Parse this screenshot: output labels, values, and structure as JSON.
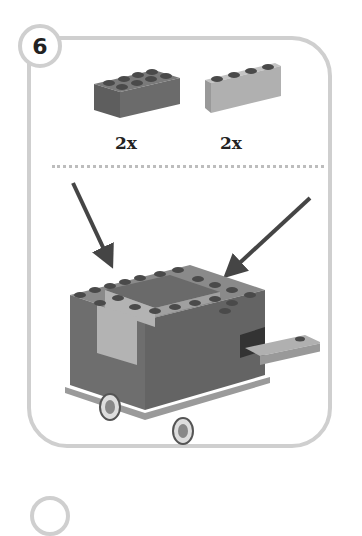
{
  "step": {
    "number": "6"
  },
  "parts": [
    {
      "name": "2x4 brick",
      "color": "#6b6b6b",
      "quantity": "2x"
    },
    {
      "name": "1x4 brick",
      "color": "#b0b0b0",
      "quantity": "2x"
    }
  ],
  "colors": {
    "frame": "#cfcfcf",
    "dark_brick": "#6b6b6b",
    "light_brick": "#b0b0b0",
    "arrow": "#454545"
  }
}
